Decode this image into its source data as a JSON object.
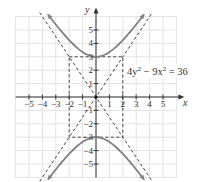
{
  "chart_data": {
    "type": "line",
    "title": "",
    "equation_label": "4y² − 9x² = 36",
    "xlabel": "x",
    "ylabel": "y",
    "xlim": [
      -6,
      6
    ],
    "ylim": [
      -6,
      6
    ],
    "grid": true,
    "x_ticks": [
      -5,
      -4,
      -3,
      -2,
      -1,
      1,
      2,
      3,
      4,
      5
    ],
    "x_tick_labels": [
      "−5",
      "−4",
      "−3",
      "−2",
      "−1",
      "1",
      "2",
      "3",
      "4",
      "5"
    ],
    "y_ticks": [
      -5,
      -4,
      -3,
      -2,
      -1,
      1,
      2,
      3,
      4,
      5
    ],
    "y_tick_labels": [
      "−5",
      "−4",
      "−3",
      "−2",
      "−1",
      "1",
      "2",
      "3",
      "4",
      "5"
    ],
    "series": [
      {
        "name": "upper branch",
        "style": "solid",
        "equation": "y = 3*sqrt(1 + x^2/4)",
        "x_range": [
          -3.6,
          3.6
        ],
        "vertex": [
          0,
          3
        ]
      },
      {
        "name": "lower branch",
        "style": "solid",
        "equation": "y = -3*sqrt(1 + x^2/4)",
        "x_range": [
          -3.6,
          3.6
        ],
        "vertex": [
          0,
          -3
        ]
      },
      {
        "name": "asymptote 1",
        "style": "dashed",
        "equation": "y = 1.5x",
        "x_range": [
          -4.2,
          4.2
        ]
      },
      {
        "name": "asymptote 2",
        "style": "dashed",
        "equation": "y = -1.5x",
        "x_range": [
          -4.2,
          4.2
        ]
      },
      {
        "name": "fundamental rectangle",
        "style": "dashed",
        "corners": [
          [
            -2,
            3
          ],
          [
            2,
            3
          ],
          [
            2,
            -3
          ],
          [
            -2,
            -3
          ]
        ]
      }
    ],
    "colors": {
      "curve": "#808080",
      "dashed": "#444444",
      "grid": "#e3e3e3",
      "axis": "#333333"
    }
  }
}
